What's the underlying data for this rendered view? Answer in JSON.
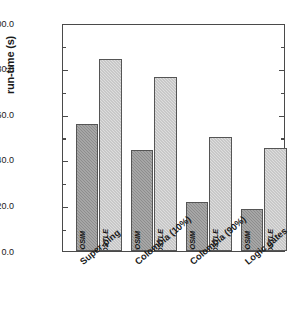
{
  "chart_data": {
    "type": "bar",
    "title": "",
    "xlabel": "",
    "ylabel": "run-time (s)",
    "ylim": [
      0.0,
      100.0
    ],
    "ytick_labels": [
      "0.0",
      "20.0",
      "40.0",
      "60.0",
      "80.0",
      "100.0"
    ],
    "ytick_values": [
      0,
      20,
      40,
      60,
      80,
      100
    ],
    "yminor_values": [
      10,
      30,
      50,
      70,
      90
    ],
    "grid": false,
    "legend": "none (in-bar labels)",
    "categories": [
      "Super-ping",
      "Colombia (10%)",
      "Colombia (90%)",
      "Logic gates"
    ],
    "series": [
      {
        "name": "MOOSIM",
        "color": "#8d8d8d",
        "values": [
          55.5,
          44.5,
          21.5,
          18.5
        ]
      },
      {
        "name": "APOSTLE",
        "color": "#dedede",
        "values": [
          84.0,
          76.5,
          50.0,
          45.0
        ]
      }
    ]
  },
  "axes": {
    "y_title": "run-time (s)",
    "y_ticks": [
      {
        "label": "100.0",
        "value": 100
      },
      {
        "label": "80.0",
        "value": 80
      },
      {
        "label": "60.0",
        "value": 60
      },
      {
        "label": "40.0",
        "value": 40
      },
      {
        "label": "20.0",
        "value": 20
      },
      {
        "label": "0.0",
        "value": 0
      }
    ]
  },
  "bars": [
    {
      "group": "Super-ping",
      "series": "MOOSIM",
      "value": 55.5,
      "label": "MOOSIM"
    },
    {
      "group": "Super-ping",
      "series": "APOSTLE",
      "value": 84.0,
      "label": "APOSTLE"
    },
    {
      "group": "Colombia (10%)",
      "series": "MOOSIM",
      "value": 44.5,
      "label": "MOOSIM"
    },
    {
      "group": "Colombia (10%)",
      "series": "APOSTLE",
      "value": 76.5,
      "label": "APOSTLE"
    },
    {
      "group": "Colombia (90%)",
      "series": "MOOSIM",
      "value": 21.5,
      "label": "MOOSIM"
    },
    {
      "group": "Colombia (90%)",
      "series": "APOSTLE",
      "value": 50.0,
      "label": "APOSTLE"
    },
    {
      "group": "Logic gates",
      "series": "MOOSIM",
      "value": 18.5,
      "label": "MOOSIM"
    },
    {
      "group": "Logic gates",
      "series": "APOSTLE",
      "value": 45.0,
      "label": "APOSTLE"
    }
  ],
  "category_labels": [
    {
      "text": "Super-ping"
    },
    {
      "text": "Colombia (10%)"
    },
    {
      "text": "Colombia (90%)"
    },
    {
      "text": "Logic gates"
    }
  ]
}
